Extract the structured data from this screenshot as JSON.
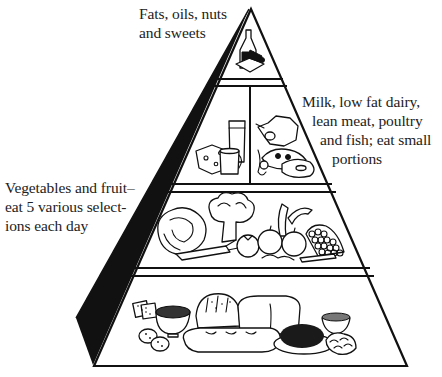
{
  "diagram": {
    "type": "food-pyramid",
    "tiers": [
      {
        "level": 1,
        "position": "top",
        "label_lines": [
          "Fats, oils, nuts",
          "and sweets"
        ],
        "foods": [
          "oil bottle",
          "sweets"
        ]
      },
      {
        "level": 2,
        "position": "upper-middle",
        "label_lines": [
          "Milk, low fat dairy,",
          "lean meat, poultry",
          "and fish; eat small",
          "portions"
        ],
        "foods": [
          "cheese",
          "glass of milk",
          "cup",
          "poultry",
          "fish",
          "meat"
        ]
      },
      {
        "level": 3,
        "position": "lower-middle",
        "label_lines": [
          "Vegetables and fruit–",
          "eat 5 various select-",
          "ions each day"
        ],
        "foods": [
          "cabbage",
          "broccoli",
          "carrot",
          "tomato",
          "banana",
          "apple",
          "grapes"
        ]
      },
      {
        "level": 4,
        "position": "base",
        "label_lines": [],
        "foods": [
          "crackers",
          "cereal bowl",
          "potatoes",
          "bread loaves",
          "baguette",
          "rice bowl",
          "pasta"
        ]
      }
    ],
    "colors": {
      "line": "#111111",
      "shadow": "#111111",
      "background": "#ffffff",
      "text": "#222222"
    }
  }
}
